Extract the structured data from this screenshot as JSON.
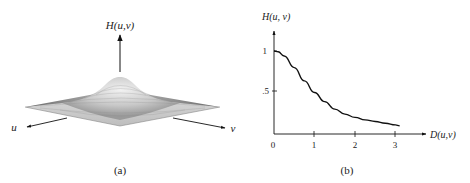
{
  "figure": {
    "panel_a": {
      "caption": "(a)",
      "axis_z_label": "H(u,v)",
      "axis_u_label": "u",
      "axis_v_label": "v",
      "description": "3-D perspective plot of a Gaussian lowpass filter transfer function"
    },
    "panel_b": {
      "caption": "(b)",
      "ylabel": "H(u, v)",
      "xlabel": "D(u,v)",
      "y_ticks": [
        "1",
        ".5"
      ],
      "x_ticks": [
        "0",
        "1",
        "2",
        "3"
      ]
    }
  },
  "chart_data": [
    {
      "type": "surface",
      "title": "(a)",
      "zlabel": "H(u,v)",
      "xlabel": "u",
      "ylabel": "v",
      "shape": "Gaussian bump centered at origin, peak 1, decaying to 0 toward edges"
    },
    {
      "type": "line",
      "title": "(b)",
      "xlabel": "D(u,v)",
      "ylabel": "H(u, v)",
      "xlim": [
        0,
        3.1
      ],
      "ylim": [
        0,
        1
      ],
      "x_ticks": [
        0,
        1,
        2,
        3
      ],
      "y_ticks": [
        0.5,
        1
      ],
      "grid": false,
      "series": [
        {
          "name": "H(u,v)",
          "x": [
            0,
            0.1,
            0.25,
            0.5,
            0.75,
            1.0,
            1.25,
            1.5,
            1.75,
            2.0,
            2.25,
            2.5,
            2.75,
            3.0,
            3.1
          ],
          "y": [
            1.0,
            0.99,
            0.94,
            0.8,
            0.64,
            0.5,
            0.39,
            0.3,
            0.24,
            0.2,
            0.17,
            0.15,
            0.13,
            0.11,
            0.1
          ]
        }
      ]
    }
  ]
}
